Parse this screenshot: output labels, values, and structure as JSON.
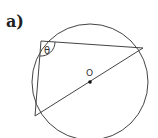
{
  "part_label": "a)",
  "diagram": {
    "type": "circle-geometry",
    "circle": {
      "cx": 90,
      "cy": 82,
      "r": 58
    },
    "center": {
      "label": "O",
      "x": 90,
      "y": 82
    },
    "vertices": {
      "A": {
        "x": 41,
        "y": 41
      },
      "B": {
        "x": 143,
        "y": 48
      },
      "C": {
        "x": 35,
        "y": 116
      }
    },
    "angle": {
      "label": "θ",
      "at": "A"
    }
  },
  "colors": {
    "stroke": "#444444",
    "text": "#333333"
  }
}
